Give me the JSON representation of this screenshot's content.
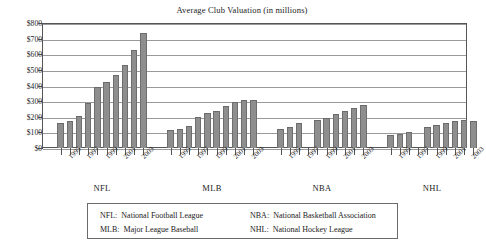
{
  "chart_data": {
    "type": "bar",
    "title": "Average Club Valuation  (in millions)",
    "xlabel": "",
    "ylabel": "",
    "ylim": [
      0,
      800
    ],
    "ytick_values": [
      0,
      100,
      200,
      300,
      400,
      500,
      600,
      700,
      800
    ],
    "ytick_labels": [
      "$0",
      "$100",
      "$200",
      "$300",
      "$400",
      "$500",
      "$600",
      "$700",
      "$800"
    ],
    "grid": true,
    "legend_position": "below-plot",
    "units": "millions of US dollars",
    "groups": [
      {
        "name": "NFL",
        "label": "NFL",
        "x_tick_labels": [
          "1995",
          "1997",
          "1999",
          "2001",
          "2003"
        ],
        "points": [
          {
            "year": "1994",
            "value": 160,
            "labeled": false
          },
          {
            "year": "1995",
            "value": 175,
            "labeled": true
          },
          {
            "year": "1996",
            "value": 205,
            "labeled": false
          },
          {
            "year": "1997",
            "value": 288,
            "labeled": true
          },
          {
            "year": "1998",
            "value": 388,
            "labeled": false
          },
          {
            "year": "1999",
            "value": 425,
            "labeled": true
          },
          {
            "year": "2000",
            "value": 468,
            "labeled": false
          },
          {
            "year": "2001",
            "value": 533,
            "labeled": true
          },
          {
            "year": "2002",
            "value": 630,
            "labeled": false
          },
          {
            "year": "2003",
            "value": 735,
            "labeled": true
          }
        ]
      },
      {
        "name": "MLB",
        "label": "MLB",
        "x_tick_labels": [
          "1995",
          "1997",
          "1999",
          "2001",
          "2003"
        ],
        "points": [
          {
            "year": "1994",
            "value": 115,
            "labeled": false
          },
          {
            "year": "1995",
            "value": 120,
            "labeled": true
          },
          {
            "year": "1996",
            "value": 142,
            "labeled": false
          },
          {
            "year": "1997",
            "value": 200,
            "labeled": true
          },
          {
            "year": "1998",
            "value": 225,
            "labeled": false
          },
          {
            "year": "1999",
            "value": 238,
            "labeled": true
          },
          {
            "year": "2000",
            "value": 268,
            "labeled": false
          },
          {
            "year": "2001",
            "value": 292,
            "labeled": true
          },
          {
            "year": "2002",
            "value": 305,
            "labeled": false
          },
          {
            "year": "2003",
            "value": 305,
            "labeled": true
          }
        ]
      },
      {
        "name": "NBA",
        "label": "NBA",
        "x_tick_labels": [
          "1995",
          "1997",
          "1999",
          "2001",
          "2003"
        ],
        "points": [
          {
            "year": "1994",
            "value": 120,
            "labeled": false
          },
          {
            "year": "1995",
            "value": 137,
            "labeled": true
          },
          {
            "year": "1996",
            "value": 158,
            "labeled": false
          },
          {
            "year": "1997",
            "value": null,
            "labeled": true
          },
          {
            "year": "1998",
            "value": 180,
            "labeled": false
          },
          {
            "year": "1999",
            "value": 193,
            "labeled": true
          },
          {
            "year": "2000",
            "value": 217,
            "labeled": false
          },
          {
            "year": "2001",
            "value": 235,
            "labeled": true
          },
          {
            "year": "2002",
            "value": 257,
            "labeled": false
          },
          {
            "year": "2003",
            "value": 277,
            "labeled": true
          }
        ]
      },
      {
        "name": "NHL",
        "label": "NHL",
        "x_tick_labels": [
          "1995",
          "1997",
          "1999",
          "2001",
          "2003"
        ],
        "points": [
          {
            "year": "1994",
            "value": 82,
            "labeled": false
          },
          {
            "year": "1995",
            "value": 88,
            "labeled": true
          },
          {
            "year": "1996",
            "value": 103,
            "labeled": false
          },
          {
            "year": "1997",
            "value": null,
            "labeled": true
          },
          {
            "year": "1998",
            "value": 137,
            "labeled": false
          },
          {
            "year": "1999",
            "value": 147,
            "labeled": true
          },
          {
            "year": "2000",
            "value": 162,
            "labeled": false
          },
          {
            "year": "2001",
            "value": 170,
            "labeled": true
          },
          {
            "year": "2002",
            "value": 178,
            "labeled": false
          },
          {
            "year": "2003",
            "value": 172,
            "labeled": true
          }
        ]
      }
    ],
    "colors": {
      "bar_fill": "#8e8e8e",
      "bar_edge": "#6a6a6a",
      "gridline": "#9a9a9a",
      "axis": "#4a4a4a",
      "text": "#1a1a1a",
      "background": "#ffffff"
    }
  },
  "legend": {
    "entries": [
      {
        "abbr": "NFL:",
        "full": "National Football League"
      },
      {
        "abbr": "NBA:",
        "full": "National Basketball Association"
      },
      {
        "abbr": "MLB:",
        "full": "Major League Baseball"
      },
      {
        "abbr": "NHL:",
        "full": "National Hockey League"
      }
    ]
  }
}
